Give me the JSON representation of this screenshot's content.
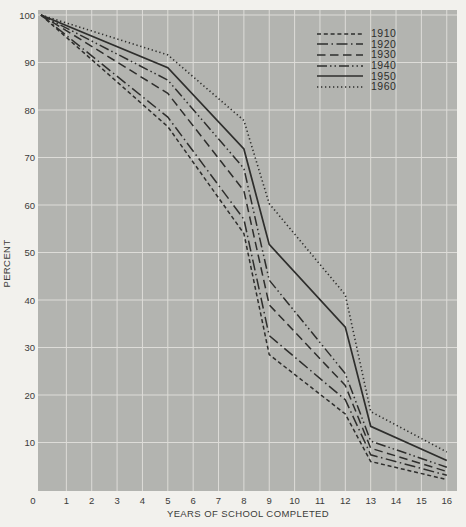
{
  "chart_data": {
    "type": "line",
    "title": "",
    "xlabel": "YEARS OF SCHOOL COMPLETED",
    "ylabel": "PERCENT",
    "xlim": [
      0,
      16
    ],
    "ylim": [
      0,
      100
    ],
    "grid": true,
    "legend_position": "top-right-inside",
    "x_tick_labels": [
      "0",
      "1",
      "2",
      "3",
      "4",
      "5",
      "6",
      "7",
      "8",
      "9",
      "10",
      "11",
      "12",
      "13",
      "14",
      "15",
      "16"
    ],
    "y_tick_labels": [
      "100",
      "90",
      "80",
      "70",
      "60",
      "50",
      "40",
      "30",
      "20",
      "10"
    ],
    "x": [
      0,
      5,
      8,
      9,
      12,
      13,
      16
    ],
    "series": [
      {
        "name": "1910",
        "style": "short-dash",
        "values": [
          100,
          76.5,
          54.0,
          28.5,
          16.0,
          6.0,
          2.2
        ]
      },
      {
        "name": "1920",
        "style": "dash-dot",
        "values": [
          100,
          78.5,
          57.0,
          32.5,
          19.0,
          7.4,
          3.1
        ]
      },
      {
        "name": "1930",
        "style": "long-dash",
        "values": [
          100,
          83.5,
          63.0,
          39.0,
          22.0,
          8.8,
          3.9
        ]
      },
      {
        "name": "1940",
        "style": "dash-dot-dot",
        "values": [
          100,
          86.3,
          67.7,
          44.2,
          24.5,
          10.3,
          4.8
        ]
      },
      {
        "name": "1950",
        "style": "solid",
        "values": [
          100,
          88.9,
          71.8,
          51.7,
          34.3,
          13.4,
          6.2
        ]
      },
      {
        "name": "1960",
        "style": "dotted",
        "values": [
          100,
          91.6,
          77.8,
          60.3,
          41.1,
          16.5,
          8.0
        ]
      }
    ],
    "colors": {
      "page_bg": "#f2f1ed",
      "plot_bg": "#b3b4b0",
      "grid": "#dddcd8",
      "line": "#2e2e2c",
      "text": "#3b3b39"
    }
  }
}
